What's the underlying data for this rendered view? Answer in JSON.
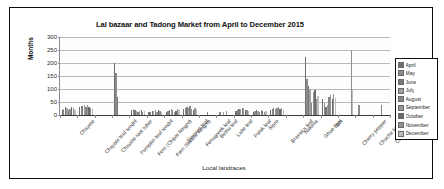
{
  "chart_data": {
    "type": "bar",
    "title": "Lal bazaar and Tadong Market from April to December 2015",
    "xlabel": "Local landraces",
    "ylabel": "Months",
    "ylim": [
      0,
      300
    ],
    "yticks": [
      0,
      50,
      100,
      150,
      200,
      250,
      300
    ],
    "grid": true,
    "legend_position": "right",
    "categories": [
      "Chayote",
      "Chayote leaf tendril",
      "Chayote root tuber",
      "Pumpkin leaf tendril",
      "Fern (Chipte Ningro)",
      "Fern (Swane Ningro)",
      "Simrayo leaf",
      "Fenugreek leaf",
      "Bethu leaf",
      "Latte leaf",
      "Palak leaf",
      "Sipro",
      "Brassica leaf",
      "Nakima",
      "Ghue Bari",
      "Bhi",
      "Cherry pepper",
      "Chuche kerela",
      "Chamsur leaf"
    ],
    "series": [
      {
        "name": "April",
        "color": "#6f6f6f",
        "values": [
          20,
          30,
          0,
          200,
          18,
          10,
          10,
          22,
          0,
          0,
          14,
          12,
          20,
          0,
          225,
          60,
          0,
          0,
          0
        ]
      },
      {
        "name": "May",
        "color": "#8c8c8c",
        "values": [
          25,
          36,
          0,
          160,
          22,
          12,
          14,
          26,
          0,
          10,
          20,
          16,
          24,
          0,
          140,
          45,
          0,
          40,
          0
        ]
      },
      {
        "name": "June",
        "color": "#777777",
        "values": [
          30,
          34,
          0,
          70,
          20,
          16,
          18,
          30,
          0,
          0,
          22,
          18,
          26,
          0,
          110,
          30,
          0,
          0,
          0
        ]
      },
      {
        "name": "July",
        "color": "#a0a0a0",
        "values": [
          28,
          40,
          0,
          0,
          16,
          14,
          24,
          28,
          0,
          12,
          24,
          14,
          22,
          0,
          100,
          38,
          0,
          0,
          0
        ]
      },
      {
        "name": "August",
        "color": "#858585",
        "values": [
          18,
          30,
          0,
          0,
          12,
          18,
          20,
          34,
          10,
          0,
          28,
          10,
          28,
          0,
          45,
          70,
          0,
          0,
          40
        ]
      },
      {
        "name": "September",
        "color": "#969696",
        "values": [
          22,
          38,
          0,
          0,
          14,
          12,
          12,
          24,
          0,
          14,
          26,
          20,
          30,
          0,
          88,
          78,
          0,
          0,
          0
        ]
      },
      {
        "name": "October",
        "color": "#6b6b6b",
        "values": [
          30,
          32,
          0,
          0,
          18,
          20,
          16,
          20,
          0,
          0,
          20,
          16,
          24,
          0,
          95,
          62,
          0,
          0,
          0
        ]
      },
      {
        "name": "November",
        "color": "#909090",
        "values": [
          26,
          28,
          0,
          0,
          10,
          14,
          22,
          26,
          0,
          0,
          18,
          12,
          26,
          0,
          60,
          80,
          250,
          0,
          0
        ]
      },
      {
        "name": "December",
        "color": "#bcbcbc",
        "values": [
          20,
          24,
          0,
          0,
          14,
          10,
          18,
          22,
          0,
          0,
          16,
          14,
          20,
          0,
          75,
          64,
          95,
          0,
          0
        ]
      }
    ]
  },
  "legend": {
    "items": [
      {
        "label": "April"
      },
      {
        "label": "May"
      },
      {
        "label": "June"
      },
      {
        "label": "July"
      },
      {
        "label": "August"
      },
      {
        "label": "September"
      },
      {
        "label": "October"
      },
      {
        "label": "November"
      },
      {
        "label": "December"
      }
    ]
  }
}
